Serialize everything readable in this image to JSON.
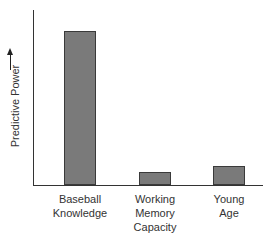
{
  "chart_data": {
    "type": "bar",
    "title": "",
    "xlabel": "",
    "ylabel": "Predictive Power",
    "ylabel_arrow": "up-arrow",
    "categories": [
      "Baseball Knowledge",
      "Working Memory Capacity",
      "Young Age"
    ],
    "category_lines": [
      [
        "Baseball",
        "Knowledge"
      ],
      [
        "Working",
        "Memory",
        "Capacity"
      ],
      [
        "Young",
        "Age"
      ]
    ],
    "values": [
      154,
      13,
      19
    ],
    "value_units": "relative (no numeric axis shown)",
    "ylim": [
      0,
      175
    ],
    "grid": false,
    "legend": null,
    "bar_color": "#7a7a7a"
  },
  "labels": {
    "ylabel": "Predictive Power",
    "cat0": [
      "Baseball",
      "Knowledge"
    ],
    "cat1": [
      "Working",
      "Memory",
      "Capacity"
    ],
    "cat2": [
      "Young",
      "Age"
    ]
  }
}
